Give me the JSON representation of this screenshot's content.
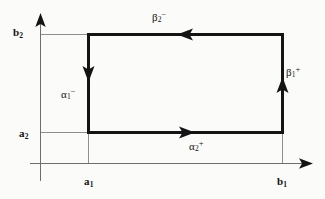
{
  "figure": {
    "background_color": "#fbfbfa",
    "line_color": "#141414",
    "grid_color": "#8a8a8a"
  },
  "axes": {
    "x_axis": {
      "name": "horizontal-axis",
      "y": 163,
      "x_start": 30,
      "x_end": 313,
      "arrow": "right"
    },
    "y_axis": {
      "name": "vertical-axis",
      "x": 40,
      "y_start": 181,
      "y_end": 13,
      "arrow": "up"
    }
  },
  "ticks": [
    {
      "id": "a1",
      "label": "a",
      "sub": "1",
      "axis": "x",
      "value_x": 88
    },
    {
      "id": "b1",
      "label": "b",
      "sub": "1",
      "axis": "x",
      "value_x": 282
    },
    {
      "id": "a2",
      "label": "a",
      "sub": "2",
      "axis": "y",
      "value_y": 132
    },
    {
      "id": "b2",
      "label": "b",
      "sub": "2",
      "axis": "y",
      "value_y": 34
    }
  ],
  "rectangle": {
    "left": 88,
    "right": 282,
    "top": 34,
    "bottom": 132
  },
  "edges": [
    {
      "id": "beta2-minus",
      "greek": "β",
      "sub": "2",
      "sup": "−",
      "side": "top",
      "direction": "left",
      "arrow_x": 186,
      "arrow_y": 34
    },
    {
      "id": "beta1-plus",
      "greek": "β",
      "sub": "1",
      "sup": "+",
      "side": "right",
      "direction": "up",
      "arrow_x": 282,
      "arrow_y": 86
    },
    {
      "id": "alpha1-minus",
      "greek": "α",
      "sub": "1",
      "sup": "−",
      "side": "left",
      "direction": "down",
      "arrow_x": 88,
      "arrow_y": 80
    },
    {
      "id": "alpha2-plus",
      "greek": "α",
      "sub": "2",
      "sup": "+",
      "side": "bottom",
      "direction": "right",
      "arrow_x": 186,
      "arrow_y": 132
    }
  ]
}
